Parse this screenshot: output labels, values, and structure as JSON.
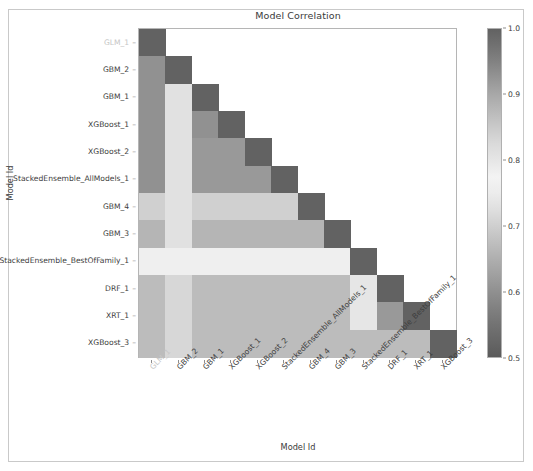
{
  "figure": {
    "title": "Model Correlation",
    "xlabel": "Model Id",
    "ylabel": "Model Id",
    "background": "#ffffff",
    "frame_color": "#c9c9c9"
  },
  "colorbar": {
    "ticks": [
      "1.0",
      "0.9",
      "0.8",
      "0.7",
      "0.6",
      "0.5"
    ],
    "vmin": 0.5,
    "vmax": 1.0
  },
  "chart_data": {
    "type": "heatmap",
    "title": "Model Correlation",
    "xlabel": "Model Id",
    "ylabel": "Model Id",
    "triangular": "lower",
    "cmap": "gray-diverging",
    "vmin": 0.5,
    "vmax": 1.0,
    "categories": [
      "GLM_1",
      "GBM_2",
      "GBM_1",
      "XGBoost_1",
      "XGBoost_2",
      "StackedEnsemble_AllModels_1",
      "GBM_4",
      "GBM_3",
      "StackedEnsemble_BestOfFamily_1",
      "DRF_1",
      "XRT_1",
      "XGBoost_3"
    ],
    "faded_categories": [
      "GLM_1"
    ],
    "values": [
      [
        1.0,
        null,
        null,
        null,
        null,
        null,
        null,
        null,
        null,
        null,
        null,
        null
      ],
      [
        0.93,
        1.0,
        null,
        null,
        null,
        null,
        null,
        null,
        null,
        null,
        null,
        null
      ],
      [
        0.93,
        0.81,
        1.0,
        null,
        null,
        null,
        null,
        null,
        null,
        null,
        null,
        null
      ],
      [
        0.93,
        0.81,
        0.93,
        1.0,
        null,
        null,
        null,
        null,
        null,
        null,
        null,
        null
      ],
      [
        0.93,
        0.81,
        0.92,
        0.92,
        1.0,
        null,
        null,
        null,
        null,
        null,
        null,
        null
      ],
      [
        0.93,
        0.81,
        0.92,
        0.92,
        0.92,
        1.0,
        null,
        null,
        null,
        null,
        null,
        null
      ],
      [
        0.84,
        0.81,
        0.84,
        0.84,
        0.84,
        0.84,
        1.0,
        null,
        null,
        null,
        null,
        null
      ],
      [
        0.88,
        0.81,
        0.88,
        0.88,
        0.88,
        0.88,
        0.88,
        1.0,
        null,
        null,
        null,
        null
      ],
      [
        0.76,
        0.76,
        0.76,
        0.76,
        0.76,
        0.76,
        0.76,
        0.76,
        1.0,
        null,
        null,
        null
      ],
      [
        0.87,
        0.83,
        0.87,
        0.87,
        0.87,
        0.87,
        0.87,
        0.87,
        0.8,
        1.0,
        null,
        null
      ],
      [
        0.87,
        0.83,
        0.87,
        0.87,
        0.87,
        0.87,
        0.87,
        0.87,
        0.8,
        0.92,
        1.0,
        null
      ],
      [
        0.87,
        0.83,
        0.87,
        0.87,
        0.87,
        0.87,
        0.87,
        0.87,
        0.87,
        0.87,
        0.87,
        1.0
      ]
    ]
  }
}
